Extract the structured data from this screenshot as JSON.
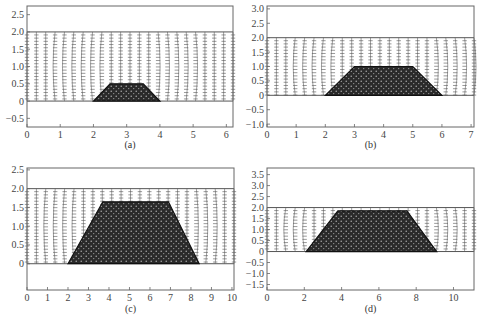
{
  "figure": {
    "panels": [
      {
        "id": "a",
        "caption": "(a)"
      },
      {
        "id": "b",
        "caption": "(b)"
      },
      {
        "id": "c",
        "caption": "(c)"
      },
      {
        "id": "d",
        "caption": "(d)"
      }
    ]
  },
  "chart_data": [
    {
      "type": "vector_field",
      "title": "",
      "caption": "(a)",
      "xlabel": "",
      "ylabel": "",
      "xlim": [
        0,
        6.2
      ],
      "ylim": [
        -0.75,
        2.75
      ],
      "xticks": [
        0,
        1,
        2,
        3,
        4,
        5,
        6
      ],
      "yticks": [
        -0.5,
        0,
        0.5,
        1.0,
        1.5,
        2.0,
        2.5
      ],
      "ytick_labels": [
        "-0.5",
        "0",
        "0.5",
        "1.0",
        "1.5",
        "2.0",
        "2.5"
      ],
      "flow_region": {
        "y_bottom": 0,
        "y_top": 2.0
      },
      "obstacle": {
        "shape": "trapezoid",
        "base": [
          2.0,
          4.0
        ],
        "top": [
          2.5,
          3.5
        ],
        "height": 0.5
      },
      "grid": false
    },
    {
      "type": "vector_field",
      "title": "",
      "caption": "(b)",
      "xlabel": "",
      "ylabel": "",
      "xlim": [
        0,
        7.1
      ],
      "ylim": [
        -1.1,
        3.1
      ],
      "xticks": [
        0,
        1,
        2,
        3,
        4,
        5,
        6,
        7
      ],
      "yticks": [
        -1.0,
        -0.5,
        0,
        0.5,
        1.0,
        1.5,
        2.0,
        2.5,
        3.0
      ],
      "ytick_labels": [
        "-1.0",
        "-0.5",
        "0",
        "0.5",
        "1.0",
        "1.5",
        "2.0",
        "2.5",
        "3.0"
      ],
      "flow_region": {
        "y_bottom": 0,
        "y_top": 2.0
      },
      "obstacle": {
        "shape": "trapezoid",
        "base": [
          2.0,
          6.0
        ],
        "top": [
          3.0,
          5.0
        ],
        "height": 1.0
      },
      "grid": false
    },
    {
      "type": "vector_field",
      "title": "",
      "caption": "(c)",
      "xlabel": "",
      "ylabel": "",
      "xlim": [
        0,
        10.1
      ],
      "ylim": [
        -0.7,
        2.55
      ],
      "xticks": [
        0,
        1,
        2,
        3,
        4,
        5,
        6,
        7,
        8,
        9,
        10
      ],
      "yticks": [
        0,
        0.5,
        1.0,
        1.5,
        2.0,
        2.5
      ],
      "ytick_labels": [
        "0",
        "0.5",
        "1.0",
        "1.5",
        "2.0",
        "2.5"
      ],
      "flow_region": {
        "y_bottom": 0,
        "y_top": 2.0
      },
      "obstacle": {
        "shape": "trapezoid",
        "base": [
          2.0,
          8.4
        ],
        "top": [
          3.7,
          6.9
        ],
        "height": 1.65
      },
      "grid": false
    },
    {
      "type": "vector_field",
      "title": "",
      "caption": "(d)",
      "xlabel": "",
      "ylabel": "",
      "xlim": [
        0,
        11.1
      ],
      "ylim": [
        -1.75,
        3.8
      ],
      "xticks": [
        0,
        2,
        4,
        6,
        8,
        10
      ],
      "yticks": [
        -1.5,
        -1.0,
        -0.5,
        0,
        0.5,
        1.0,
        1.5,
        2.0,
        2.5,
        3.0,
        3.5
      ],
      "ytick_labels": [
        "-1.5",
        "-1.0",
        "-0.5",
        "0",
        "0.5",
        "1.0",
        "1.5",
        "2.0",
        "2.5",
        "3.0",
        "3.5"
      ],
      "flow_region": {
        "y_bottom": 0,
        "y_top": 2.0
      },
      "obstacle": {
        "shape": "trapezoid",
        "base": [
          2.1,
          9.1
        ],
        "top": [
          3.8,
          7.5
        ],
        "height": 1.85
      },
      "grid": false
    }
  ]
}
